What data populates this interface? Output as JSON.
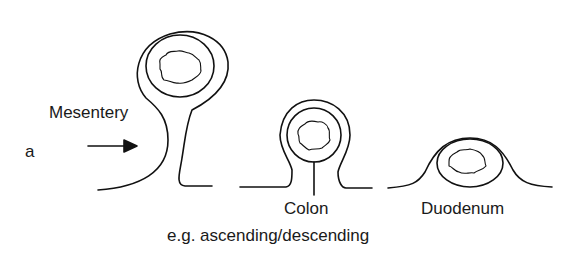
{
  "figure": {
    "panel_label": "a",
    "labels": {
      "mesentery": "Mesentery",
      "colon": "Colon",
      "duodenum": "Duodenum",
      "example": "e.g. ascending/descending"
    },
    "structures": [
      {
        "name": "Intraperitoneal organ with mesentery",
        "label": "Mesentery"
      },
      {
        "name": "Secondarily retroperitoneal organ",
        "label": "Colon"
      },
      {
        "name": "Retroperitoneal organ",
        "label": "Duodenum"
      }
    ],
    "colors": {
      "line": "#111111",
      "background": "#ffffff"
    }
  }
}
